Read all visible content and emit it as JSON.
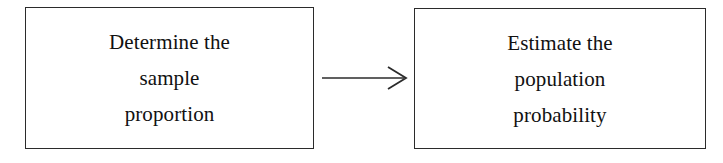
{
  "diagram": {
    "type": "flow",
    "background_color": "#ffffff",
    "stroke_color": "#2b2b2b",
    "text_color": "#111111",
    "nodes": [
      {
        "id": "determine-sample-proportion",
        "shape": "rectangle",
        "lines": [
          "Determine the",
          "sample",
          "proportion"
        ]
      },
      {
        "id": "estimate-population-probability",
        "shape": "rectangle",
        "lines": [
          "Estimate the",
          "population",
          "probability"
        ]
      }
    ],
    "connector": {
      "id": "arrow-left-to-right",
      "style": "open-arrowhead",
      "direction": "right",
      "label": ""
    }
  }
}
